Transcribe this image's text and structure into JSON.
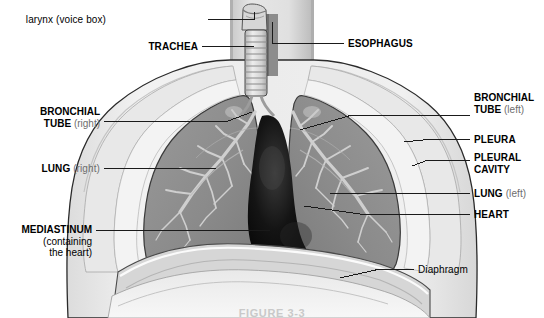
{
  "figure": {
    "caption": "FIGURE 3-3",
    "palette": {
      "background": "#ffffff",
      "body_fill": "#ececec",
      "body_shade": "#d8d8d8",
      "pleura_band": "#e4e4e4",
      "lung_fill": "#8f8f8f",
      "lung_shade": "#7c7c7c",
      "bronchi": "#cfcfcf",
      "heart_dark": "#0d0d0d",
      "trachea_fill": "#c6c6c6",
      "outline": "#2a2a2a",
      "leader_line": "#1a1a1a",
      "label_text": "#000000",
      "label_side_text": "#6d6d6d"
    }
  },
  "labels": [
    {
      "id": "larynx",
      "name": "label-larynx",
      "text": "larynx (voice box)",
      "style": "regular",
      "align": "right",
      "x": 106,
      "y": 14
    },
    {
      "id": "trachea",
      "name": "label-trachea",
      "text": "TRACHEA",
      "style": "bold",
      "align": "right",
      "x": 138,
      "y": 41
    },
    {
      "id": "esophagus",
      "name": "label-esophagus",
      "text": "ESOPHAGUS",
      "style": "bold",
      "align": "left",
      "x": 348,
      "y": 38
    },
    {
      "id": "bronchial-tube-right",
      "name": "label-bronchial-tube-right",
      "term": "BRONCHIAL",
      "term2": "TUBE",
      "side": "(right)",
      "style": "bold",
      "align": "right",
      "x": 14,
      "y": 110
    },
    {
      "id": "bronchial-tube-left",
      "name": "label-bronchial-tube-left",
      "term": "BRONCHIAL",
      "term2": "TUBE",
      "side": "(left)",
      "style": "bold",
      "align": "left",
      "x": 474,
      "y": 110
    },
    {
      "id": "pleura",
      "name": "label-pleura",
      "text": "PLEURA",
      "style": "bold",
      "align": "left",
      "x": 474,
      "y": 135
    },
    {
      "id": "pleural-cavity",
      "name": "label-pleural-cavity",
      "term": "PLEURAL",
      "term2": "CAVITY",
      "style": "bold",
      "align": "left",
      "x": 474,
      "y": 153
    },
    {
      "id": "lung-right",
      "name": "label-lung-right",
      "term": "LUNG",
      "side": "(right)",
      "style": "bold",
      "align": "right",
      "x": 14,
      "y": 163
    },
    {
      "id": "lung-left",
      "name": "label-lung-left",
      "term": "LUNG",
      "side": "(left)",
      "style": "bold",
      "align": "left",
      "x": 474,
      "y": 188
    },
    {
      "id": "heart",
      "name": "label-heart",
      "text": "HEART",
      "style": "bold",
      "align": "left",
      "x": 474,
      "y": 209
    },
    {
      "id": "mediastinum",
      "name": "label-mediastinum",
      "term": "MEDIASTINUM",
      "line2": "(containing",
      "line3": "the heart)",
      "style": "bold",
      "align": "right",
      "x": 4,
      "y": 225
    },
    {
      "id": "diaphragm",
      "name": "label-diaphragm",
      "text": "Diaphragm",
      "style": "regular",
      "align": "left",
      "x": 418,
      "y": 264
    }
  ],
  "structures": [
    {
      "id": "larynx",
      "label": "larynx (voice box)"
    },
    {
      "id": "trachea",
      "label": "TRACHEA"
    },
    {
      "id": "esophagus",
      "label": "ESOPHAGUS"
    },
    {
      "id": "bronchi",
      "label": "BRONCHIAL TUBE"
    },
    {
      "id": "pleura",
      "label": "PLEURA"
    },
    {
      "id": "pleural-cavity",
      "label": "PLEURAL CAVITY"
    },
    {
      "id": "lung",
      "label": "LUNG"
    },
    {
      "id": "heart",
      "label": "HEART"
    },
    {
      "id": "mediastinum",
      "label": "MEDIASTINUM"
    },
    {
      "id": "diaphragm",
      "label": "Diaphragm"
    }
  ]
}
